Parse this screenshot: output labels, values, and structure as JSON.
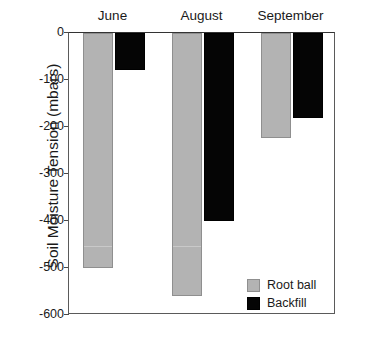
{
  "chart_data": {
    "type": "bar",
    "title": "",
    "xlabel": "",
    "ylabel": "Soil Moisture Tension (mbars)",
    "categories": [
      "June",
      "August",
      "September"
    ],
    "series": [
      {
        "name": "Root ball",
        "color": "#b3b3b3",
        "values": [
          -500,
          -560,
          -224
        ]
      },
      {
        "name": "Backfill",
        "color": "#050505",
        "values": [
          -78,
          -400,
          -180
        ]
      }
    ],
    "ylim": [
      -600,
      0
    ],
    "yticks": [
      0,
      -100,
      -200,
      -300,
      -400,
      -500,
      -600
    ],
    "ytick_labels": [
      "0",
      "-100",
      "-200",
      "-300",
      "-400",
      "-500",
      "-600"
    ],
    "grid": false,
    "legend_position": "bottom-right",
    "legend_entries": [
      "Root ball",
      "Backfill"
    ],
    "category_label_position": "top",
    "annotations": []
  },
  "axis": {
    "y_title": "Soil Moisture Tension (mbars)",
    "ticks": [
      {
        "label": "0",
        "value": 0
      },
      {
        "label": "-100",
        "value": -100
      },
      {
        "label": "-200",
        "value": -200
      },
      {
        "label": "-300",
        "value": -300
      },
      {
        "label": "-400",
        "value": -400
      },
      {
        "label": "-500",
        "value": -500
      },
      {
        "label": "-600",
        "value": -600
      }
    ]
  },
  "groups": [
    {
      "label": "June"
    },
    {
      "label": "August"
    },
    {
      "label": "September"
    }
  ],
  "legend": {
    "items": [
      {
        "label": "Root ball",
        "color": "#b3b3b3"
      },
      {
        "label": "Backfill",
        "color": "#050505"
      }
    ]
  }
}
